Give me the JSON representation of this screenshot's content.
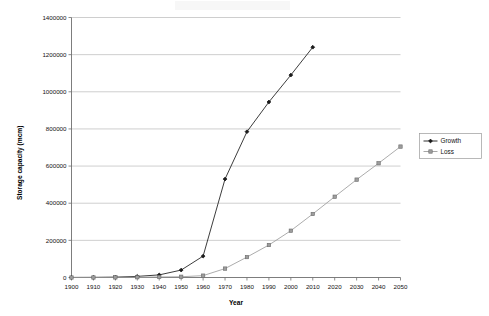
{
  "chart_data": {
    "type": "line",
    "title": "",
    "xlabel": "Year",
    "ylabel": "Storage capacity (mcm)",
    "x": [
      1900,
      1910,
      1920,
      1930,
      1940,
      1950,
      1960,
      1970,
      1980,
      1990,
      2000,
      2010,
      2020,
      2030,
      2040,
      2050
    ],
    "xtick_labels": [
      "1900",
      "1910",
      "1920",
      "1930",
      "1940",
      "1950",
      "1960",
      "1970",
      "1980",
      "1990",
      "2000",
      "2010",
      "2020",
      "2030",
      "2040",
      "2050"
    ],
    "ytick_labels": [
      "0",
      "200000",
      "400000",
      "600000",
      "800000",
      "1000000",
      "1200000",
      "1400000"
    ],
    "ytick_values": [
      0,
      200000,
      400000,
      600000,
      800000,
      1000000,
      1200000,
      1400000
    ],
    "ylim": [
      0,
      1400000
    ],
    "xlim": [
      1900,
      2050
    ],
    "grid": "horizontal",
    "legend_position": "right",
    "series": [
      {
        "name": "Growth",
        "color": "#1a1a1a",
        "marker": "diamond",
        "x": [
          1900,
          1910,
          1920,
          1930,
          1940,
          1950,
          1960,
          1970,
          1980,
          1990,
          2000,
          2010
        ],
        "values": [
          500,
          800,
          2000,
          6000,
          14000,
          40000,
          115000,
          530000,
          785000,
          945000,
          1090000,
          1240000
        ]
      },
      {
        "name": "Loss",
        "color": "#9d9d9d",
        "marker": "square",
        "x": [
          1900,
          1910,
          1920,
          1930,
          1940,
          1950,
          1960,
          1970,
          1980,
          1990,
          2000,
          2010,
          2020,
          2030,
          2040,
          2050
        ],
        "values": [
          0,
          200,
          600,
          1500,
          3000,
          4000,
          10000,
          48000,
          110000,
          175000,
          252000,
          342000,
          435000,
          527000,
          615000,
          705000
        ]
      }
    ]
  },
  "legend": {
    "items": [
      {
        "label": "Growth"
      },
      {
        "label": "Loss"
      }
    ]
  },
  "axes": {
    "x_title": "Year",
    "y_title": "Storage capacity (mcm)"
  }
}
